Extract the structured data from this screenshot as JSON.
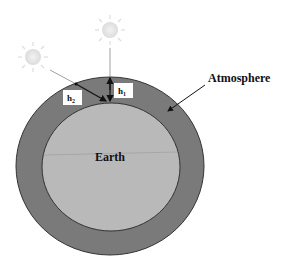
{
  "diagram": {
    "labels": {
      "atmosphere": "Atmosphere",
      "earth": "Earth",
      "h1": "h",
      "h1_sub": "1",
      "h2": "h",
      "h2_sub": "2"
    },
    "colors": {
      "atmosphere_fill": "#7a7a7a",
      "earth_fill": "#b9b9b9",
      "outline": "#333333",
      "sun": "#e6e6e6",
      "label_box": "#ffffff"
    },
    "icons": {
      "sun_overhead": "sun-icon",
      "sun_oblique": "sun-icon"
    }
  }
}
